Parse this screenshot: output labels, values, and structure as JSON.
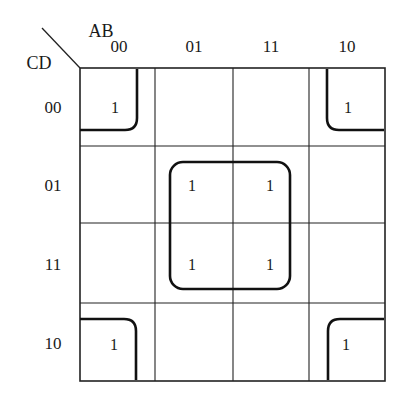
{
  "kmap": {
    "row_variable": "CD",
    "col_variable": "AB",
    "col_labels": [
      "00",
      "01",
      "11",
      "10"
    ],
    "row_labels": [
      "00",
      "01",
      "11",
      "10"
    ],
    "cells": [
      [
        "1",
        "",
        "",
        "1"
      ],
      [
        "",
        "1",
        "1",
        ""
      ],
      [
        "",
        "1",
        "1",
        ""
      ],
      [
        "1",
        "",
        "",
        "1"
      ]
    ],
    "groups": [
      {
        "name": "corners",
        "cells": [
          [
            0,
            0
          ],
          [
            0,
            3
          ],
          [
            3,
            0
          ],
          [
            3,
            3
          ]
        ]
      },
      {
        "name": "center-quad",
        "cells": [
          [
            1,
            1
          ],
          [
            1,
            2
          ],
          [
            2,
            1
          ],
          [
            2,
            2
          ]
        ]
      }
    ]
  }
}
